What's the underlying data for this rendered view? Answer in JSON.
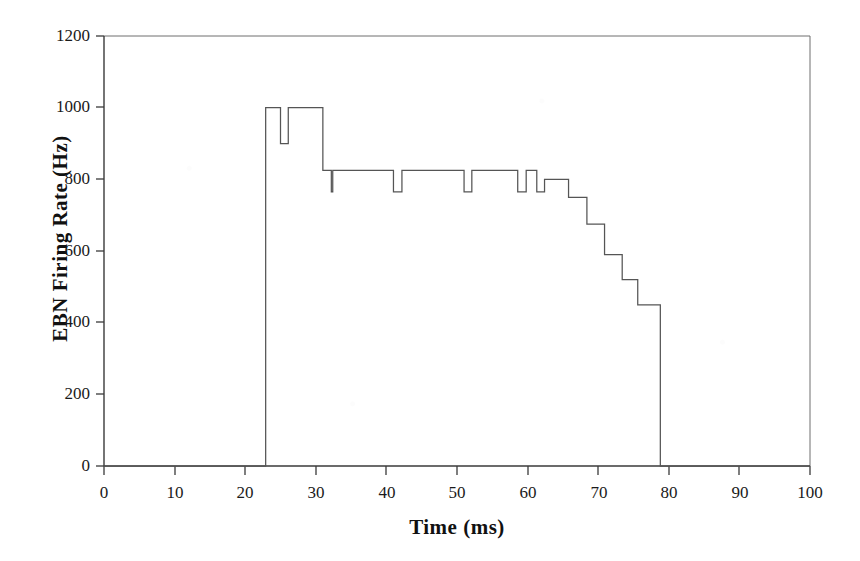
{
  "chart_data": {
    "type": "line",
    "title": "",
    "xlabel": "Time (ms)",
    "ylabel": "EBN Firing Rate (Hz)",
    "xlim": [
      0,
      100
    ],
    "ylim": [
      0,
      1200
    ],
    "xticks": [
      0,
      10,
      20,
      30,
      40,
      50,
      60,
      70,
      80,
      90,
      100
    ],
    "yticks": [
      0,
      200,
      400,
      600,
      800,
      1000,
      1200
    ],
    "xtick_labels": [
      "0",
      "10",
      "20",
      "30",
      "40",
      "50",
      "60",
      "70",
      "80",
      "90",
      "100"
    ],
    "ytick_labels": [
      "0",
      "200",
      "400",
      "600",
      "800",
      "1000",
      "1200"
    ],
    "grid": false,
    "legend": null,
    "line_color": "#555555",
    "axis_color": "#333333",
    "background": "#ffffff",
    "series": [
      {
        "name": "EBN firing rate",
        "style": "step-post",
        "x": [
          0,
          22.9,
          22.9,
          25.0,
          25.0,
          26.1,
          26.1,
          31.0,
          31.0,
          32.2,
          32.2,
          32.4,
          32.4,
          41.0,
          41.0,
          42.2,
          42.2,
          51.0,
          51.0,
          52.1,
          52.1,
          58.6,
          58.6,
          59.8,
          59.8,
          61.3,
          61.3,
          62.4,
          62.4,
          65.8,
          65.8,
          68.4,
          68.4,
          70.9,
          70.9,
          73.4,
          73.4,
          75.6,
          75.6,
          78.8,
          78.8,
          100
        ],
        "y": [
          0,
          0,
          1000,
          1000,
          900,
          900,
          1000,
          1000,
          825,
          825,
          765,
          765,
          825,
          825,
          765,
          765,
          825,
          825,
          765,
          765,
          825,
          825,
          765,
          765,
          825,
          825,
          765,
          765,
          800,
          800,
          750,
          750,
          675,
          675,
          590,
          590,
          520,
          520,
          450,
          450,
          0,
          0
        ]
      }
    ],
    "annotations": [
      {
        "label": "burst onset",
        "x": 23,
        "y": 1000
      },
      {
        "label": "peak plateau",
        "x": 28,
        "y": 1000
      },
      {
        "label": "sustained plateau",
        "x": 45,
        "y": 825
      },
      {
        "label": "decay staircase start",
        "x": 66,
        "y": 750
      },
      {
        "label": "burst offset",
        "x": 78.8,
        "y": 0
      }
    ]
  },
  "figure": {
    "plot_left_px": 104,
    "plot_right_px": 810,
    "plot_top_px": 36,
    "plot_bottom_px": 466
  }
}
